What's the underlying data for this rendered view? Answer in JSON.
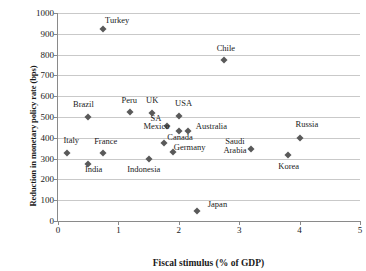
{
  "chart_data": {
    "type": "scatter",
    "title": "",
    "xlabel": "Fiscal stimulus (% of GDP)",
    "ylabel": "Reduction in monetary policy rate (bps)",
    "xlim": [
      0,
      5
    ],
    "ylim": [
      0,
      1000
    ],
    "xticks": [
      "0",
      "1",
      "2",
      "3",
      "4",
      "5"
    ],
    "yticks": [
      "0",
      "100",
      "200",
      "300",
      "400",
      "500",
      "600",
      "700",
      "800",
      "900",
      "1000"
    ],
    "grid": "horizontal",
    "legend": "none",
    "marker_color": "#595959",
    "points": [
      {
        "label": "Turkey",
        "x": 0.75,
        "y": 925,
        "lx": 0.98,
        "ly": 960
      },
      {
        "label": "Chile",
        "x": 2.75,
        "y": 775,
        "lx": 2.78,
        "ly": 828
      },
      {
        "label": "Brazil",
        "x": 0.5,
        "y": 500,
        "lx": 0.42,
        "ly": 556
      },
      {
        "label": "Peru",
        "x": 1.2,
        "y": 525,
        "lx": 1.18,
        "ly": 578
      },
      {
        "label": "UK",
        "x": 1.55,
        "y": 520,
        "lx": 1.56,
        "ly": 578
      },
      {
        "label": "USA",
        "x": 2.0,
        "y": 505,
        "lx": 2.08,
        "ly": 562
      },
      {
        "label": "SA",
        "x": 1.8,
        "y": 455,
        "lx": 1.62,
        "ly": 492
      },
      {
        "label": "Mexico",
        "x": 2.0,
        "y": 435,
        "lx": 1.63,
        "ly": 452
      },
      {
        "label": "Australia",
        "x": 2.15,
        "y": 435,
        "lx": 2.54,
        "ly": 450
      },
      {
        "label": "Canada",
        "x": 1.75,
        "y": 375,
        "lx": 2.02,
        "ly": 398
      },
      {
        "label": "Germany",
        "x": 1.9,
        "y": 330,
        "lx": 2.18,
        "ly": 350
      },
      {
        "label": "Italy",
        "x": 0.15,
        "y": 325,
        "lx": 0.22,
        "ly": 385
      },
      {
        "label": "France",
        "x": 0.75,
        "y": 325,
        "lx": 0.79,
        "ly": 382
      },
      {
        "label": "India",
        "x": 0.5,
        "y": 275,
        "lx": 0.59,
        "ly": 243
      },
      {
        "label": "Indonesia",
        "x": 1.5,
        "y": 300,
        "lx": 1.42,
        "ly": 243
      },
      {
        "label": "Saudi\nArabia",
        "x": 3.2,
        "y": 345,
        "lx": 2.93,
        "ly": 378
      },
      {
        "label": "Korea",
        "x": 3.8,
        "y": 315,
        "lx": 3.82,
        "ly": 258
      },
      {
        "label": "Russia",
        "x": 4.0,
        "y": 400,
        "lx": 4.12,
        "ly": 462
      },
      {
        "label": "Japan",
        "x": 2.3,
        "y": 50,
        "lx": 2.64,
        "ly": 78
      }
    ]
  }
}
